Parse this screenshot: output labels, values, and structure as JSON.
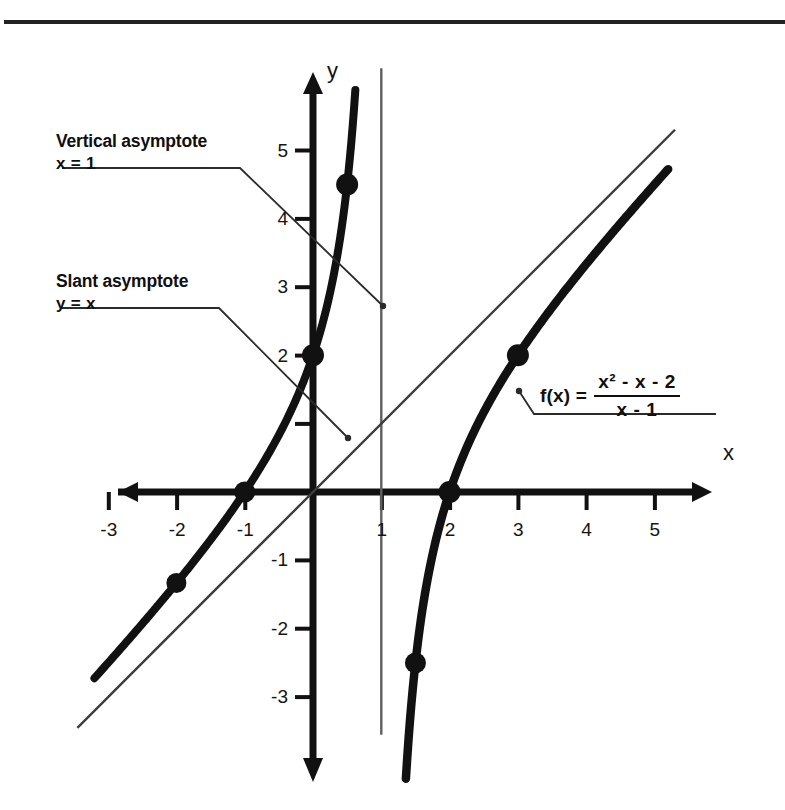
{
  "page": {
    "clipped_header_text": "",
    "has_top_rule": true,
    "background": "#ffffff",
    "ink_color": "#111111"
  },
  "annotations": [
    {
      "id": "vertical-asymptote",
      "line1": "Vertical asymptote",
      "line2": "x = 1",
      "leader_from": [
        240,
        152
      ],
      "leader_to": [
        383,
        305
      ]
    },
    {
      "id": "slant-asymptote",
      "line1": "Slant asymptote",
      "line2": "y = x",
      "leader_from": [
        219,
        293
      ],
      "leader_to": [
        348,
        437
      ]
    }
  ],
  "formula": {
    "lhs": "f(x) =",
    "numerator": "x² - x - 2",
    "numerator_base": "x",
    "numerator_exp": "2",
    "numerator_rest": " - x - 2",
    "denominator": "x - 1",
    "leader_from": [
      534,
      414
    ],
    "leader_to": [
      519,
      391
    ]
  },
  "chart_data": {
    "type": "line",
    "title": "",
    "xlabel": "x",
    "ylabel": "y",
    "xlim": [
      -3.6,
      5.6
    ],
    "ylim": [
      -3.6,
      5.4
    ],
    "grid": false,
    "legend": null,
    "function": "f(x) = (x^2 - x - 2)/(x - 1)",
    "x_ticks": [
      -3,
      -2,
      -1,
      1,
      2,
      3,
      4,
      5
    ],
    "x_tick_labels": [
      "-3",
      "-2",
      "-1",
      "1",
      "2",
      "3",
      "4",
      "5"
    ],
    "y_ticks": [
      5,
      4,
      3,
      2,
      1,
      -1,
      -2,
      -3
    ],
    "y_tick_labels": [
      "5",
      "4",
      "3",
      "2",
      "",
      "-1",
      "-2",
      "-3"
    ],
    "series": [
      {
        "name": "f(x) = (x^2 - x - 2)/(x - 1)",
        "style": "thick-curve",
        "color": "#111111",
        "branches": [
          {
            "name": "left-branch",
            "x_range": [
              -3.2,
              0.62
            ],
            "points": [
              [
                -3.2,
                -2.45
              ],
              [
                -3.0,
                -2.3
              ],
              [
                -2.5,
                -1.93
              ],
              [
                -2.0,
                -1.33
              ],
              [
                -1.5,
                -0.7
              ],
              [
                -1.0,
                0.0
              ],
              [
                -0.5,
                0.83
              ],
              [
                0.0,
                2.0
              ],
              [
                0.25,
                2.92
              ],
              [
                0.4,
                3.73
              ],
              [
                0.5,
                4.5
              ],
              [
                0.62,
                5.45
              ]
            ]
          },
          {
            "name": "right-branch",
            "x_range": [
              1.36,
              5.2
            ],
            "points": [
              [
                1.36,
                -3.45
              ],
              [
                1.4,
                -3.1
              ],
              [
                1.5,
                -2.5
              ],
              [
                1.75,
                -1.44
              ],
              [
                2.0,
                0.0
              ],
              [
                2.5,
                1.17
              ],
              [
                3.0,
                2.0
              ],
              [
                3.5,
                2.7
              ],
              [
                4.0,
                3.33
              ],
              [
                4.5,
                3.93
              ],
              [
                5.0,
                4.5
              ],
              [
                5.2,
                4.73
              ]
            ]
          }
        ]
      },
      {
        "name": "slant asymptote y = x",
        "style": "thin-line",
        "color": "#3a3a3a",
        "points": [
          [
            -3.45,
            -3.45
          ],
          [
            5.3,
            5.3
          ]
        ]
      },
      {
        "name": "vertical asymptote x = 1",
        "style": "thin-vertical",
        "color": "#5a5a5a",
        "x": 1,
        "y_range": [
          -3.55,
          6.2
        ]
      }
    ],
    "marked_points": [
      {
        "x": -2,
        "y": -1.33,
        "label": ""
      },
      {
        "x": -1,
        "y": 0,
        "label": ""
      },
      {
        "x": 0,
        "y": 2,
        "label": ""
      },
      {
        "x": 0.5,
        "y": 4.5,
        "label": ""
      },
      {
        "x": 1.5,
        "y": -2.5,
        "label": ""
      },
      {
        "x": 2,
        "y": 0,
        "label": ""
      },
      {
        "x": 3,
        "y": 2,
        "label": ""
      }
    ]
  }
}
